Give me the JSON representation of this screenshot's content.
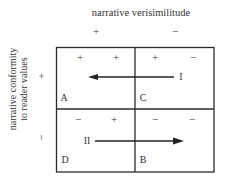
{
  "diagram": {
    "column_axis": {
      "title": "narrative verisimilitude",
      "signs": [
        "+",
        "−"
      ]
    },
    "row_axis": {
      "title_lines": [
        "narrative conformity",
        "to reader values"
      ],
      "signs": [
        "+",
        "−"
      ]
    },
    "cells": {
      "A": {
        "label": "A",
        "signs": [
          "+",
          "+"
        ]
      },
      "C": {
        "label": "C",
        "signs": [
          "+",
          "−"
        ]
      },
      "D": {
        "label": "D",
        "signs": [
          "−",
          "+"
        ]
      },
      "B": {
        "label": "B",
        "signs": [
          "−",
          "−"
        ]
      }
    },
    "arrows": [
      {
        "label": "I",
        "from": "C",
        "to": "A",
        "direction": "left"
      },
      {
        "label": "II",
        "from": "D",
        "to": "B",
        "direction": "right"
      }
    ],
    "line_color": "#2b2b2b"
  }
}
